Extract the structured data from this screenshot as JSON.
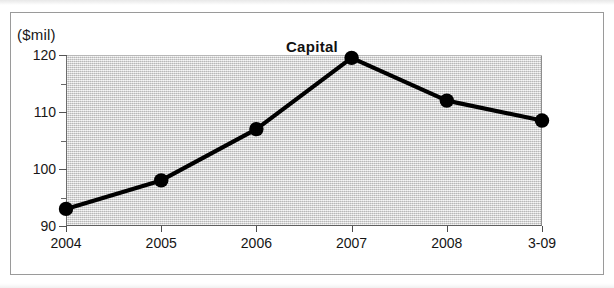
{
  "figure": {
    "unit_label": "($mil)",
    "title": "Capital"
  },
  "chart_data": {
    "type": "line",
    "title": "Capital",
    "subtitle": "",
    "xlabel": "",
    "ylabel": "($mil)",
    "unit": "$mil",
    "categories": [
      "2004",
      "2005",
      "2006",
      "2007",
      "2008",
      "3-09"
    ],
    "values": [
      93,
      98,
      107,
      119.5,
      112,
      108.5
    ],
    "series": [
      {
        "name": "Capital",
        "values": [
          93,
          98,
          107,
          119.5,
          112,
          108.5
        ]
      }
    ],
    "ylim": [
      90,
      120
    ],
    "ytick_labels": [
      "90",
      "100",
      "110",
      "120"
    ],
    "ytick_values": [
      90,
      100,
      110,
      120
    ],
    "yminor_values": [
      95,
      105,
      115
    ],
    "xtick_labels": [
      "2004",
      "2005",
      "2006",
      "2007",
      "2008",
      "3-09"
    ],
    "grid": false,
    "legend": "none",
    "marker": "filled-circle",
    "line_color": "#000000",
    "marker_color": "#000000",
    "plot_background": "#dcdcdc",
    "frame_color": "#9a9a9a"
  }
}
